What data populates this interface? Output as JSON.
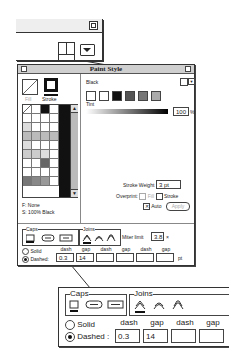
{
  "top_zoom": {
    "icons": [
      "layout-toggle-icon",
      "menu-arrow-icon"
    ]
  },
  "dialog": {
    "title": "Paint Style",
    "fill_label": "Fill",
    "stroke_label": "Stroke",
    "color_name": "Black",
    "tint_label": "Tint",
    "tint_value": "100",
    "tint_unit": "%",
    "fill_info": "F: None",
    "stroke_info": "S: 100% Black",
    "stroke_weight_label": "Stroke Weight",
    "stroke_weight_value": "3 pt",
    "overprint_label": "Overprint:",
    "overprint_fill": "Fill",
    "overprint_stroke": "Stroke",
    "auto_label": "Auto",
    "apply_label": "Apply",
    "caps_label": "Caps",
    "joins_label": "Joins",
    "miter_label": "Miter limit",
    "miter_value": "3.8",
    "miter_unit": "×",
    "solid_label": "Solid",
    "dashed_label": "Dashed:",
    "dash_headers": [
      "dash",
      "gap",
      "dash",
      "gap",
      "dash",
      "gap"
    ],
    "dash_values": [
      "0.3",
      "14",
      "",
      "",
      "",
      ""
    ],
    "dash_unit": "pt"
  },
  "lower_zoom": {
    "caps_label": "Caps",
    "joins_label": "Joins",
    "solid_label": "Solid",
    "dashed_label": "Dashed :",
    "dash_headers": [
      "dash",
      "gap",
      "dash",
      "gap"
    ],
    "dash_values": [
      "0.3",
      "14",
      "",
      ""
    ]
  }
}
